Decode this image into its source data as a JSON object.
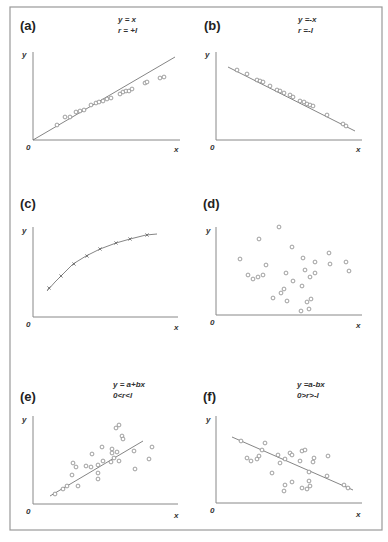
{
  "figure": {
    "frame_color": "#999999",
    "point_color": "#777777",
    "line_color": "#666666"
  },
  "chart_data": [
    {
      "id": "a",
      "type": "scatter",
      "panel_label": "(a)",
      "title_lines": [
        "y = x",
        "r = +l"
      ],
      "xlabel": "x",
      "ylabel": "y",
      "origin_label": "0",
      "fit": "linear, positive slope",
      "origin_px": [
        33,
        140
      ],
      "x_axis_end_px": [
        180,
        140
      ],
      "y_axis_top_px": [
        33,
        52
      ],
      "line_px": [
        [
          33,
          140
        ],
        [
          175,
          57
        ]
      ],
      "points_px": [
        [
          57,
          125
        ],
        [
          65,
          117
        ],
        [
          70,
          117
        ],
        [
          76,
          112
        ],
        [
          80,
          111
        ],
        [
          84,
          110
        ],
        [
          91,
          105
        ],
        [
          96,
          103
        ],
        [
          99,
          102
        ],
        [
          103,
          101
        ],
        [
          107,
          99
        ],
        [
          111,
          98
        ],
        [
          120,
          94
        ],
        [
          123,
          92
        ],
        [
          126,
          91
        ],
        [
          129,
          91
        ],
        [
          132,
          89
        ],
        [
          145,
          83
        ],
        [
          147,
          82
        ],
        [
          160,
          78
        ],
        [
          164,
          77
        ]
      ],
      "label_pos": [
        [
          20,
          30
        ],
        [
          118,
          22
        ],
        [
          118,
          33
        ],
        [
          22,
          57
        ],
        [
          26,
          150
        ],
        [
          174,
          152
        ]
      ]
    },
    {
      "id": "b",
      "type": "scatter",
      "panel_label": "(b)",
      "title_lines": [
        "y =-x",
        "r =-l"
      ],
      "xlabel": "x",
      "ylabel": "y",
      "origin_label": "0",
      "fit": "linear, negative slope",
      "origin_px": [
        216,
        140
      ],
      "x_axis_end_px": [
        362,
        140
      ],
      "y_axis_top_px": [
        216,
        52
      ],
      "line_px": [
        [
          228,
          67
        ],
        [
          355,
          131
        ]
      ],
      "points_px": [
        [
          237,
          70
        ],
        [
          247,
          74
        ],
        [
          257,
          80
        ],
        [
          260,
          81
        ],
        [
          263,
          82
        ],
        [
          270,
          86
        ],
        [
          277,
          90
        ],
        [
          280,
          91
        ],
        [
          284,
          93
        ],
        [
          290,
          95
        ],
        [
          293,
          97
        ],
        [
          300,
          101
        ],
        [
          304,
          102
        ],
        [
          307,
          104
        ],
        [
          310,
          105
        ],
        [
          313,
          106
        ],
        [
          327,
          115
        ],
        [
          343,
          124
        ],
        [
          346,
          126
        ]
      ],
      "label_pos": [
        [
          204,
          30
        ],
        [
          298,
          22
        ],
        [
          298,
          33
        ],
        [
          205,
          57
        ],
        [
          210,
          150
        ],
        [
          356,
          152
        ]
      ]
    },
    {
      "id": "c",
      "type": "line",
      "panel_label": "(c)",
      "title_lines": [],
      "xlabel": "x",
      "ylabel": "y",
      "origin_label": "0",
      "fit": "concave curve (increasing, saturating)",
      "origin_px": [
        33,
        317
      ],
      "x_axis_end_px": [
        178,
        317
      ],
      "y_axis_top_px": [
        33,
        227
      ],
      "curve_px": [
        [
          47,
          291
        ],
        [
          55,
          282
        ],
        [
          62,
          275
        ],
        [
          73,
          264
        ],
        [
          86,
          256
        ],
        [
          100,
          249
        ],
        [
          116,
          243
        ],
        [
          130,
          239
        ],
        [
          146,
          235
        ],
        [
          157,
          234
        ]
      ],
      "points_px": [
        [
          49,
          288
        ],
        [
          61,
          276
        ],
        [
          74,
          264
        ],
        [
          87,
          256
        ],
        [
          100,
          249
        ],
        [
          116,
          243
        ],
        [
          130,
          239
        ],
        [
          147,
          235
        ]
      ],
      "label_pos": [
        [
          20,
          208
        ],
        [
          22,
          233
        ],
        [
          26,
          327
        ],
        [
          174,
          330
        ]
      ]
    },
    {
      "id": "d",
      "type": "scatter",
      "panel_label": "(d)",
      "title_lines": [],
      "xlabel": "x",
      "ylabel": "y",
      "origin_label": "0",
      "fit": "none (no correlation)",
      "origin_px": [
        216,
        315
      ],
      "x_axis_end_px": [
        362,
        315
      ],
      "y_axis_top_px": [
        216,
        227
      ],
      "points_px": [
        [
          240,
          259
        ],
        [
          259,
          239
        ],
        [
          279,
          227
        ],
        [
          292,
          247
        ],
        [
          266,
          265
        ],
        [
          248,
          275
        ],
        [
          253,
          279
        ],
        [
          258,
          277
        ],
        [
          263,
          275
        ],
        [
          286,
          273
        ],
        [
          303,
          258
        ],
        [
          315,
          262
        ],
        [
          305,
          270
        ],
        [
          310,
          277
        ],
        [
          315,
          273
        ],
        [
          329,
          253
        ],
        [
          330,
          264
        ],
        [
          346,
          262
        ],
        [
          349,
          271
        ],
        [
          293,
          281
        ],
        [
          302,
          286
        ],
        [
          284,
          289
        ],
        [
          281,
          293
        ],
        [
          273,
          298
        ],
        [
          287,
          301
        ],
        [
          311,
          299
        ],
        [
          307,
          302
        ],
        [
          309,
          309
        ],
        [
          301,
          311
        ]
      ],
      "label_pos": [
        [
          203,
          208
        ],
        [
          206,
          233
        ],
        [
          210,
          325
        ],
        [
          356,
          328
        ]
      ]
    },
    {
      "id": "e",
      "type": "scatter",
      "panel_label": "(e)",
      "title_lines": [
        "y = a+bx",
        "0<r<l"
      ],
      "xlabel": "x",
      "ylabel": "y",
      "origin_label": "0",
      "fit": "linear, positive slope, scattered",
      "origin_px": [
        33,
        504
      ],
      "x_axis_end_px": [
        178,
        504
      ],
      "y_axis_top_px": [
        33,
        416
      ],
      "line_px": [
        [
          50,
          496
        ],
        [
          143,
          441
        ]
      ],
      "points_px": [
        [
          55,
          494
        ],
        [
          63,
          489
        ],
        [
          67,
          486
        ],
        [
          78,
          486
        ],
        [
          72,
          475
        ],
        [
          73,
          463
        ],
        [
          76,
          467
        ],
        [
          86,
          466
        ],
        [
          91,
          467
        ],
        [
          92,
          454
        ],
        [
          98,
          465
        ],
        [
          98,
          473
        ],
        [
          98,
          479
        ],
        [
          103,
          461
        ],
        [
          102,
          447
        ],
        [
          111,
          462
        ],
        [
          112,
          449
        ],
        [
          112,
          453
        ],
        [
          114,
          458
        ],
        [
          117,
          452
        ],
        [
          119,
          461
        ],
        [
          116,
          428
        ],
        [
          119,
          425
        ],
        [
          122,
          436
        ],
        [
          123,
          439
        ],
        [
          134,
          451
        ],
        [
          135,
          469
        ],
        [
          149,
          459
        ],
        [
          152,
          447
        ]
      ],
      "label_pos": [
        [
          20,
          401
        ],
        [
          113,
          387
        ],
        [
          113,
          398
        ],
        [
          22,
          422
        ],
        [
          26,
          514
        ],
        [
          174,
          518
        ]
      ]
    },
    {
      "id": "f",
      "type": "scatter",
      "panel_label": "(f)",
      "title_lines": [
        "y =a-bx",
        "0>r>-l"
      ],
      "xlabel": "x",
      "ylabel": "y",
      "origin_label": "0",
      "fit": "linear, negative slope, scattered",
      "origin_px": [
        216,
        503
      ],
      "x_axis_end_px": [
        362,
        503
      ],
      "y_axis_top_px": [
        216,
        416
      ],
      "line_px": [
        [
          232,
          437
        ],
        [
          353,
          490
        ]
      ],
      "points_px": [
        [
          241,
          441
        ],
        [
          265,
          443
        ],
        [
          262,
          450
        ],
        [
          247,
          458
        ],
        [
          251,
          461
        ],
        [
          257,
          459
        ],
        [
          259,
          456
        ],
        [
          278,
          455
        ],
        [
          280,
          463
        ],
        [
          285,
          459
        ],
        [
          290,
          453
        ],
        [
          292,
          455
        ],
        [
          302,
          451
        ],
        [
          305,
          450
        ],
        [
          300,
          461
        ],
        [
          314,
          458
        ],
        [
          313,
          462
        ],
        [
          328,
          456
        ],
        [
          272,
          473
        ],
        [
          309,
          472
        ],
        [
          327,
          476
        ],
        [
          309,
          481
        ],
        [
          292,
          482
        ],
        [
          285,
          485
        ],
        [
          284,
          491
        ],
        [
          302,
          488
        ],
        [
          307,
          489
        ],
        [
          310,
          486
        ],
        [
          344,
          485
        ],
        [
          348,
          488
        ]
      ],
      "label_pos": [
        [
          203,
          401
        ],
        [
          297,
          387
        ],
        [
          297,
          398
        ],
        [
          206,
          422
        ],
        [
          210,
          513
        ],
        [
          356,
          517
        ]
      ]
    }
  ]
}
